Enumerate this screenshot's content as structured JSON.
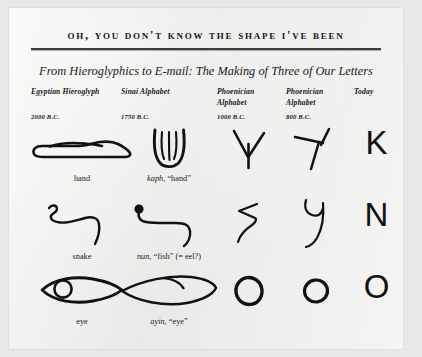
{
  "headline": "Oh, You Don't Know the Shape I've Been",
  "subtitle": "From Hieroglyphics to E-mail: The Making of Three of Our Letters",
  "columns": [
    {
      "name": "Egyptian Hieroglyph",
      "line1": "Egyptian Hieroglyph",
      "line2": "",
      "date": "2000 B.C."
    },
    {
      "name": "Sinai Alphabet",
      "line1": "Sinai Alphabet",
      "line2": "",
      "date": "1750 B.C."
    },
    {
      "name": "Phoenician Alphabet",
      "line1": "Phoenician",
      "line2": "Alphabet",
      "date": "1000 B.C."
    },
    {
      "name": "Phoenician Alphabet",
      "line1": "Phoenician",
      "line2": "Alphabet",
      "date": "800 B.C."
    },
    {
      "name": "Today",
      "line1": "Today",
      "line2": "",
      "date": ""
    }
  ],
  "rows": [
    {
      "letter": "K",
      "egyptian_glyph": "hand-hieroglyph",
      "egyptian_caption": "hand",
      "sinai_glyph": "kaph-palm-glyph",
      "sinai_caption_italic": "kaph,",
      "sinai_caption_rest": "“hand”",
      "phoenician_1000_glyph": "downward-arrow-kaph-glyph",
      "phoenician_800_glyph": "rotated-y-kaph-glyph",
      "today_letter": "K"
    },
    {
      "letter": "N",
      "egyptian_glyph": "snake-hieroglyph",
      "egyptian_caption": "snake",
      "sinai_glyph": "nun-eel-glyph",
      "sinai_caption_italic": "nun,",
      "sinai_caption_rest": "“fish” (= eel?)",
      "phoenician_1000_glyph": "zigzag-nun-glyph",
      "phoenician_800_glyph": "hooked-nun-glyph",
      "today_letter": "N"
    },
    {
      "letter": "O",
      "egyptian_glyph": "eye-hieroglyph",
      "egyptian_caption": "eye",
      "sinai_glyph": "ayin-eye-glyph",
      "sinai_caption_italic": "ayin,",
      "sinai_caption_rest": "“eye”",
      "phoenician_1000_glyph": "circle-ayin-glyph",
      "phoenician_800_glyph": "circle-ayin-glyph",
      "today_letter": "O"
    }
  ],
  "colors": {
    "ink": "#1a1a1a",
    "rule": "#3c3c3c",
    "paper": "#eeeeec",
    "background": "#e8e8e6"
  }
}
